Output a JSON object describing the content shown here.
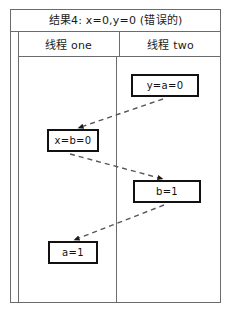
{
  "diagram": {
    "title": "结果4: x=0,y=0 (错误的)",
    "columns": [
      {
        "label": "线程 one"
      },
      {
        "label": "线程 two"
      }
    ],
    "events": [
      {
        "id": "y-a-0",
        "label": "y=a=0",
        "column": "two"
      },
      {
        "id": "x-b-0",
        "label": "x=b=0",
        "column": "one"
      },
      {
        "id": "b-1",
        "label": "b=1",
        "column": "two"
      },
      {
        "id": "a-1",
        "label": "a=1",
        "column": "one"
      }
    ],
    "arrows": [
      {
        "id": "arrow-y-a-0-to-x-b-0",
        "from": "y-a-0",
        "to": "x-b-0",
        "style": "dashed"
      },
      {
        "id": "arrow-x-b-0-to-b-1",
        "from": "x-b-0",
        "to": "b-1",
        "style": "dashed"
      },
      {
        "id": "arrow-b-1-to-a-1",
        "from": "b-1",
        "to": "a-1",
        "style": "dashed"
      }
    ],
    "colors": {
      "frame": "#6b6b6b",
      "box_border": "#111111",
      "text": "#1a1a1a",
      "arrow": "#555555",
      "background": "#ffffff"
    }
  }
}
